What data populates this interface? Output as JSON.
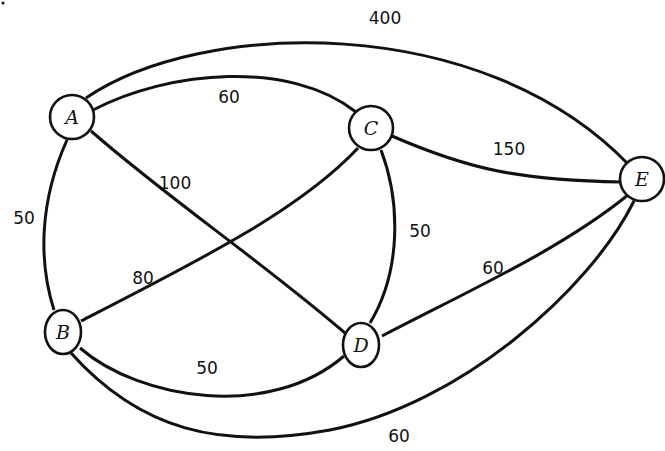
{
  "diagram": {
    "type": "weighted-undirected-graph",
    "colors": {
      "stroke": "#111111",
      "background": "#ffffff",
      "node_fill": "#ffffff"
    },
    "nodes": [
      {
        "id": "A",
        "label": "A",
        "x": 72,
        "y": 117
      },
      {
        "id": "B",
        "label": "B",
        "x": 63,
        "y": 332
      },
      {
        "id": "C",
        "label": "C",
        "x": 371,
        "y": 128
      },
      {
        "id": "D",
        "label": "D",
        "x": 361,
        "y": 345
      },
      {
        "id": "E",
        "label": "E",
        "x": 642,
        "y": 179
      }
    ],
    "edges": [
      {
        "from": "A",
        "to": "E",
        "weight": "400"
      },
      {
        "from": "A",
        "to": "C",
        "weight": "60"
      },
      {
        "from": "A",
        "to": "D",
        "weight": "100"
      },
      {
        "from": "A",
        "to": "B",
        "weight": "50"
      },
      {
        "from": "C",
        "to": "E",
        "weight": "150"
      },
      {
        "from": "B",
        "to": "C",
        "weight": "80"
      },
      {
        "from": "C",
        "to": "D",
        "weight": "50"
      },
      {
        "from": "D",
        "to": "E",
        "weight": "60"
      },
      {
        "from": "B",
        "to": "D",
        "weight": "50"
      },
      {
        "from": "B",
        "to": "E",
        "weight": "60"
      }
    ]
  }
}
